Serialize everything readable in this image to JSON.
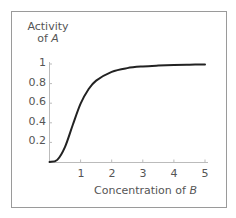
{
  "chart_data": {
    "type": "line",
    "title": "",
    "xlabel": "Concentration of B",
    "ylabel": "Activity of A",
    "xlim": [
      0,
      5
    ],
    "ylim": [
      0,
      1
    ],
    "grid": false,
    "legend": null,
    "x_ticks": [
      1,
      2,
      3,
      4,
      5
    ],
    "y_ticks": [
      0.2,
      0.4,
      0.6,
      0.8,
      1
    ],
    "series": [
      {
        "name": "Activity of A",
        "x": [
          0,
          0.25,
          0.5,
          0.75,
          1,
          1.25,
          1.5,
          2,
          2.5,
          3,
          3.5,
          4,
          4.5,
          5
        ],
        "y": [
          0,
          0.022,
          0.155,
          0.38,
          0.595,
          0.74,
          0.83,
          0.92,
          0.958,
          0.975,
          0.984,
          0.99,
          0.993,
          0.995
        ]
      }
    ],
    "curve_color": "#222222"
  },
  "labels": {
    "ylabel_line1": "Activity",
    "ylabel_line2_prefix": "of ",
    "ylabel_var": "A",
    "xlabel_prefix": "Concentration of ",
    "xlabel_var": "B",
    "y_ticks": [
      "0.2",
      "0.4",
      "0.6",
      "0.8",
      "1"
    ],
    "x_ticks": [
      "1",
      "2",
      "3",
      "4",
      "5"
    ]
  }
}
